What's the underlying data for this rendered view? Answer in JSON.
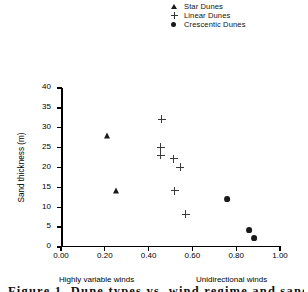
{
  "chart_data": {
    "type": "scatter",
    "title": "",
    "xlabel": "",
    "ylabel": "Sand thickness (m)",
    "xlim": [
      0.0,
      1.0
    ],
    "ylim": [
      0,
      40
    ],
    "grid": false,
    "legend_position": "top-right",
    "x_ticks": [
      "0.00",
      "0.20",
      "0.40",
      "0.60",
      "0.80",
      "1.00"
    ],
    "x_tick_values": [
      0.0,
      0.2,
      0.4,
      0.6,
      0.8,
      1.0
    ],
    "y_ticks": [
      "0",
      "5",
      "10",
      "15",
      "20",
      "25",
      "30",
      "35",
      "40"
    ],
    "y_tick_values": [
      0,
      5,
      10,
      15,
      20,
      25,
      30,
      35,
      40
    ],
    "annotations": [
      {
        "text": "Highly variable winds",
        "position": "below-axis-left"
      },
      {
        "text": "Unidirectional winds",
        "position": "below-axis-right"
      }
    ],
    "series": [
      {
        "name": "Star Dunes",
        "marker": "filled-triangle",
        "color": "#1a1a1a",
        "points": [
          {
            "x": 0.21,
            "y": 28.0
          },
          {
            "x": 0.25,
            "y": 14.0
          }
        ]
      },
      {
        "name": "Linear Dunes",
        "marker": "plus",
        "color": "#3a3a3a",
        "points": [
          {
            "x": 0.46,
            "y": 32.2
          },
          {
            "x": 0.455,
            "y": 25.1
          },
          {
            "x": 0.455,
            "y": 23.1
          },
          {
            "x": 0.515,
            "y": 22.2
          },
          {
            "x": 0.545,
            "y": 20.1
          },
          {
            "x": 0.52,
            "y": 14.2
          },
          {
            "x": 0.57,
            "y": 8.2
          }
        ]
      },
      {
        "name": "Crescentic Dunes",
        "marker": "filled-circle",
        "color": "#1a1a1a",
        "points": [
          {
            "x": 0.76,
            "y": 12.1
          },
          {
            "x": 0.86,
            "y": 4.2
          },
          {
            "x": 0.88,
            "y": 2.2
          }
        ]
      }
    ]
  },
  "legend": {
    "items": [
      {
        "label": "Star Dunes",
        "marker": "filled-triangle"
      },
      {
        "label": "Linear Dunes",
        "marker": "plus"
      },
      {
        "label": "Crescentic Dunes",
        "marker": "filled-circle"
      }
    ]
  },
  "axes": {
    "y_title": "Sand thickness (m)",
    "note_left": "Highly variable winds",
    "note_right": "Unidirectional winds"
  },
  "caption": {
    "text": "Figure 1. Dune types vs. wind regime and sand thickness"
  }
}
